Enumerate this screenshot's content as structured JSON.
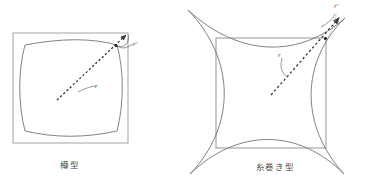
{
  "figure": {
    "title_visible": false,
    "background_color": "#ffffff",
    "stroke_color": "#6b6b6b",
    "text_color": "#4a4a4a",
    "panels": [
      {
        "id": "barrel",
        "caption": "樽型",
        "caption_romaji_meaning": "barrel type",
        "undistorted_square": {
          "x": 13,
          "y": 33,
          "width": 115,
          "height": 110
        },
        "distorted_outline": "convex-bulging-square",
        "arrow": {
          "style": "dashed",
          "from": [
            57,
            100
          ],
          "to": [
            128,
            33
          ],
          "head": "filled-triangle"
        },
        "labels": [
          {
            "name": "r-outer",
            "text": "r'",
            "x": 133,
            "y": 40
          },
          {
            "name": "r-inner",
            "text": "r",
            "x": 95,
            "y": 82
          }
        ],
        "markers": [
          {
            "name": "distorted-point",
            "x": 116,
            "y": 45,
            "shape": "dot"
          }
        ]
      },
      {
        "id": "pincushion",
        "caption": "糸巻き型",
        "caption_romaji_meaning": "pincushion type",
        "undistorted_square": {
          "x": 216,
          "y": 38,
          "width": 110,
          "height": 110
        },
        "distorted_outline": "concave-pinched-square",
        "arrow": {
          "style": "dashed",
          "from": [
            271,
            95
          ],
          "to": [
            331,
            22
          ],
          "head": "filled-triangle"
        },
        "labels": [
          {
            "name": "r-outer",
            "text": "r'",
            "x": 334,
            "y": 2
          },
          {
            "name": "r-inner",
            "text": "r",
            "x": 278,
            "y": 51
          }
        ],
        "markers": [
          {
            "name": "undistorted-corner",
            "x": 326,
            "y": 38,
            "shape": "dot"
          }
        ]
      }
    ]
  }
}
